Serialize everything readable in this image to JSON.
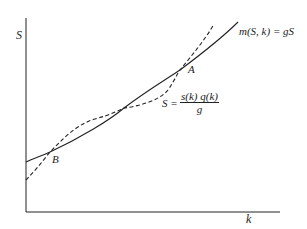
{
  "diagram": {
    "axes": {
      "y_label": "S",
      "x_label": "k"
    },
    "curves": [
      {
        "name": "solid",
        "label": "m(S, k) = gS",
        "style": "solid"
      },
      {
        "name": "dashed",
        "label_lhs": "S =",
        "label_num": "s(k) q(k)",
        "label_den": "g",
        "style": "dashed"
      }
    ],
    "points": [
      {
        "label": "A"
      },
      {
        "label": "B"
      }
    ]
  }
}
